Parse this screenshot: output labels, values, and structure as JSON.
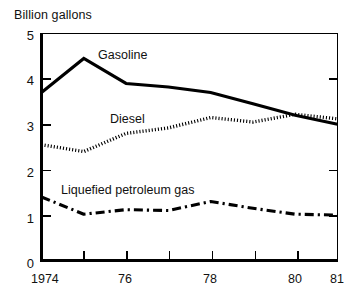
{
  "chart_data": {
    "type": "line",
    "title": "Billion gallons",
    "xlabel": "",
    "ylabel": "Billion gallons",
    "xlim": [
      1974,
      1981
    ],
    "ylim": [
      0,
      5
    ],
    "grid": false,
    "legend_position": "inline-labels",
    "x": [
      1974,
      1975,
      1976,
      1977,
      1978,
      1979,
      1980,
      1981
    ],
    "xtick_labels": [
      "1974",
      "76",
      "78",
      "80",
      "81"
    ],
    "xtick_values": [
      1974,
      1976,
      1978,
      1980,
      1981
    ],
    "ytick_labels": [
      "0",
      "1",
      "2",
      "3",
      "4",
      "5"
    ],
    "ytick_values": [
      0,
      1,
      2,
      3,
      4,
      5
    ],
    "series": [
      {
        "name": "Gasoline",
        "style": "solid",
        "color": "#000000",
        "values": [
          3.7,
          4.45,
          3.9,
          3.82,
          3.7,
          3.45,
          3.2,
          3.0
        ]
      },
      {
        "name": "Diesel",
        "style": "dotted",
        "color": "#000000",
        "values": [
          2.55,
          2.4,
          2.8,
          2.92,
          3.15,
          3.05,
          3.22,
          3.12
        ]
      },
      {
        "name": "Liquefied petroleum gas",
        "style": "dash-dot",
        "color": "#000000",
        "values": [
          1.4,
          1.02,
          1.12,
          1.1,
          1.3,
          1.15,
          1.02,
          1.0
        ]
      }
    ],
    "annotations": [
      {
        "text": "Gasoline",
        "x": 1976.2,
        "y": 4.3
      },
      {
        "text": "Diesel",
        "x": 1975.4,
        "y": 3.35
      },
      {
        "text": "Liquefied petroleum gas",
        "x": 1974.5,
        "y": 1.75
      }
    ]
  },
  "labels": {
    "axis_title": "Billion gallons",
    "y": [
      "5",
      "4",
      "3",
      "2",
      "1",
      "0"
    ],
    "x": [
      "1974",
      "76",
      "78",
      "80",
      "81"
    ],
    "series_gasoline": "Gasoline",
    "series_diesel": "Diesel",
    "series_lpg": "Liquefied petroleum gas"
  },
  "caption": {
    "text": ""
  }
}
